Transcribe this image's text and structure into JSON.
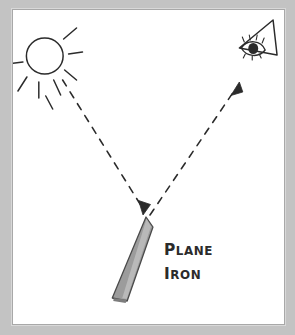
{
  "figure": {
    "style": "hand-drawn pencil sketch",
    "background_color": "#c3c3c3",
    "paper_color": "#ffffff",
    "ink_color": "#2b2b2b",
    "blade_color": "#9c9c9c"
  },
  "labels": {
    "plane": {
      "first": "P",
      "rest": "LANE"
    },
    "iron": {
      "first": "I",
      "rest": "RON"
    },
    "plane_full": "PLANE",
    "iron_full": "IRON"
  },
  "elements": {
    "sun": {
      "name": "sun",
      "center_x": 41,
      "center_y": 54,
      "radius": 18,
      "ray_count": 8
    },
    "eye": {
      "name": "eye",
      "x": 266,
      "y": 49,
      "description": "eye viewed in a cone of sight pointing down-left"
    },
    "plane_iron": {
      "name": "plane-iron",
      "tip_x": 145,
      "tip_y": 217,
      "heel_x": 113,
      "heel_y": 300,
      "description": "tapered grey blade angled from lower-left to upper-right tip"
    },
    "incident_ray": {
      "name": "incident-ray",
      "from": "sun",
      "to": "plane-iron",
      "start_x": 62,
      "start_y": 82,
      "end_x": 140,
      "end_y": 213,
      "dashed": true,
      "arrowhead": "end"
    },
    "reflected_ray": {
      "name": "reflected-ray",
      "from": "plane-iron",
      "to": "eye",
      "start_x": 150,
      "start_y": 213,
      "end_x": 237,
      "end_y": 92,
      "dashed": true,
      "arrowhead": "end"
    }
  }
}
